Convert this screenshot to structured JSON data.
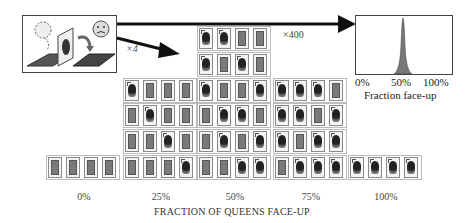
{
  "multiplier_small": "×4",
  "multiplier_large": "×400",
  "histogram": {
    "xtick_labels": [
      "0%",
      "50%",
      "100%"
    ],
    "xlabel": "Fraction face-up"
  },
  "groups": [
    {
      "label": "0%",
      "rows": [
        [
          0,
          0,
          0,
          0
        ]
      ]
    },
    {
      "label": "25%",
      "rows": [
        [
          1,
          0,
          0,
          0
        ],
        [
          0,
          1,
          0,
          0
        ],
        [
          0,
          0,
          1,
          0
        ],
        [
          0,
          0,
          0,
          1
        ]
      ]
    },
    {
      "label": "50%",
      "rows": [
        [
          1,
          1,
          0,
          0
        ],
        [
          1,
          0,
          1,
          0
        ],
        [
          1,
          0,
          0,
          1
        ],
        [
          0,
          1,
          1,
          0
        ],
        [
          0,
          1,
          0,
          1
        ],
        [
          0,
          0,
          1,
          1
        ]
      ]
    },
    {
      "label": "75%",
      "rows": [
        [
          1,
          1,
          1,
          0
        ],
        [
          1,
          1,
          0,
          1
        ],
        [
          1,
          0,
          1,
          1
        ],
        [
          0,
          1,
          1,
          1
        ]
      ]
    },
    {
      "label": "100%",
      "rows": [
        [
          1,
          1,
          1,
          1
        ]
      ]
    }
  ],
  "xlabel": "FRACTION OF QUEENS FACE-UP",
  "chart_data": {
    "type": "bar",
    "title": "",
    "categories": [
      "0%",
      "25%",
      "50%",
      "75%",
      "100%"
    ],
    "values": [
      1,
      4,
      6,
      4,
      1
    ],
    "xlabel": "FRACTION OF QUEENS FACE-UP",
    "ylabel": "",
    "inset": {
      "type": "area",
      "xlabel": "Fraction face-up",
      "xticks": [
        "0%",
        "50%",
        "100%"
      ],
      "peak_at": "50%"
    }
  }
}
